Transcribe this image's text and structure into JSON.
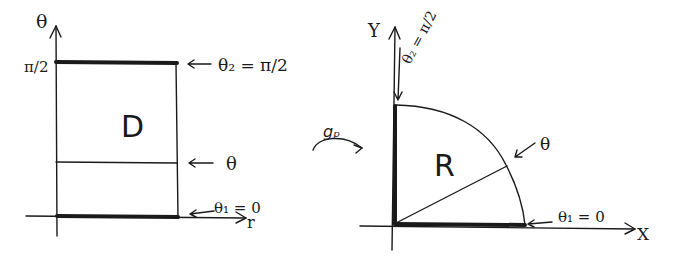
{
  "left_panel": {
    "name": "Rectangle D in (r, θ) plane",
    "vertical_axis_label": "θ",
    "horizontal_axis_label": "r",
    "tick_label_top": "π/2",
    "region_label": "D",
    "annotations": {
      "top_edge": "θ₂ = π/2",
      "middle_line": "θ",
      "bottom_edge": "θ₁ = 0"
    }
  },
  "mapping": {
    "label": "gₚ"
  },
  "right_panel": {
    "name": "Quarter disk R in (x, y) plane",
    "vertical_axis_label": "Y",
    "horizontal_axis_label": "X",
    "region_label": "R",
    "annotations": {
      "vertical_edge": "θ₂ = π/2",
      "radial_line": "θ",
      "horizontal_edge": "θ₁ = 0"
    }
  },
  "colors": {
    "ink": "#1a1a1a",
    "background": "#ffffff"
  }
}
